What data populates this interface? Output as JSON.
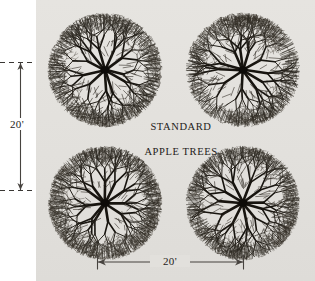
{
  "figure": {
    "background_color": "#e3e1dd",
    "page_color": "#ffffff",
    "ink_color": "#1d1b19"
  },
  "caption": {
    "line1": "STANDARD",
    "line2": "APPLE TREES"
  },
  "dimensions": {
    "vertical": {
      "label": "20'",
      "orientation": "vertical",
      "arrow_style": "double-headed",
      "guide_style": "dashed"
    },
    "horizontal": {
      "label": "20'",
      "orientation": "horizontal",
      "arrow_style": "double-headed",
      "guide_style": "tick"
    }
  },
  "trees": [
    {
      "id": "tree-top-left",
      "position": "top-left"
    },
    {
      "id": "tree-top-right",
      "position": "top-right"
    },
    {
      "id": "tree-bottom-left",
      "position": "bottom-left"
    },
    {
      "id": "tree-bottom-right",
      "position": "bottom-right"
    }
  ],
  "chart_data": {
    "type": "diagram",
    "subject": "STANDARD APPLE TREES",
    "view": "plan view (overhead)",
    "tree_count": 4,
    "grid": {
      "rows": 2,
      "cols": 2
    },
    "canopy_diameter": "20'",
    "spacing_between_trunks": "20'",
    "annotations": [
      "20'",
      "20'",
      "STANDARD",
      "APPLE TREES"
    ]
  }
}
